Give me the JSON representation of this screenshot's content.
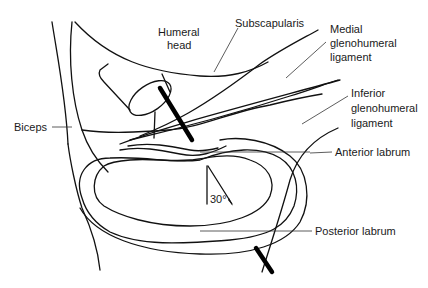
{
  "figure": {
    "type": "anatomical line drawing",
    "line_color": "#111111",
    "background": "#ffffff"
  },
  "labels": {
    "humeral_head": {
      "line1": "Humeral",
      "line2": "head"
    },
    "subscapularis": "Subscapularis",
    "medial_gh_ligament": {
      "line1": "Medial",
      "line2": "glenohumeral",
      "line3": "ligament"
    },
    "inferior_gh_ligament": {
      "line1": "Inferior",
      "line2": "glenohumeral",
      "line3": "ligament"
    },
    "biceps": "Biceps",
    "anterior_labrum": "Anterior labrum",
    "posterior_labrum": "Posterior labrum",
    "angle": "30°"
  }
}
